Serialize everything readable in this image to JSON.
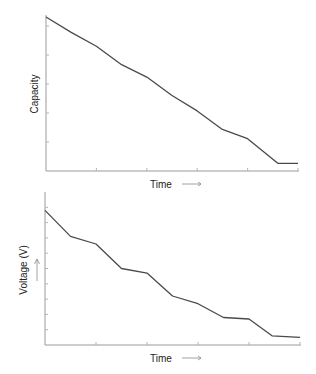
{
  "chart_data": [
    {
      "type": "line",
      "title": "",
      "xlabel": "Time",
      "ylabel": "Capacity",
      "xlabel_arrow": "→",
      "ylabel_arrow": "↑",
      "xlim": [
        0,
        10
      ],
      "ylim": [
        0,
        1
      ],
      "grid": false,
      "x_ticks": 5,
      "y_ticks": 6,
      "x": [
        0,
        1,
        2,
        3,
        4,
        5,
        6,
        7,
        8,
        9.2,
        10
      ],
      "values": [
        1.0,
        0.9,
        0.81,
        0.69,
        0.61,
        0.49,
        0.39,
        0.27,
        0.21,
        0.05,
        0.05
      ]
    },
    {
      "type": "line",
      "title": "",
      "xlabel": "Time",
      "ylabel": "Voltage (V)",
      "xlabel_arrow": "→",
      "ylabel_arrow": "↑",
      "xlim": [
        0,
        10
      ],
      "ylim": [
        0,
        1
      ],
      "grid": false,
      "x_ticks": 5,
      "y_ticks": 9,
      "x": [
        0,
        1,
        2,
        3,
        4,
        5,
        6,
        7,
        8,
        8.9,
        10
      ],
      "values": [
        0.88,
        0.71,
        0.66,
        0.5,
        0.47,
        0.32,
        0.27,
        0.18,
        0.17,
        0.06,
        0.05
      ]
    }
  ],
  "charts": {
    "top": {
      "xlabel": "Time",
      "ylabel": "Capacity"
    },
    "bottom": {
      "xlabel": "Time",
      "ylabel": "Voltage (V)"
    }
  }
}
